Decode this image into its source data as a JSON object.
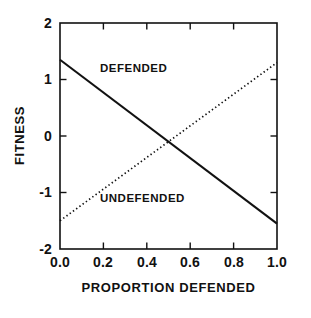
{
  "chart_data": {
    "type": "line",
    "title": "",
    "subtitle": "",
    "xlabel": "PROPORTION DEFENDED",
    "ylabel": "FITNESS",
    "xlim": [
      0.0,
      1.0
    ],
    "ylim": [
      -2,
      2
    ],
    "grid": false,
    "legend_position": "inline-annotations",
    "xticks": [
      "0.0",
      "0.2",
      "0.4",
      "0.6",
      "0.8",
      "1.0"
    ],
    "xtick_values": [
      0.0,
      0.2,
      0.4,
      0.6,
      0.8,
      1.0
    ],
    "yticks": [
      "2",
      "1",
      "0",
      "-1",
      "-2"
    ],
    "ytick_values": [
      2,
      1,
      0,
      -1,
      -2
    ],
    "series": [
      {
        "name": "DEFENDED",
        "style": "solid",
        "color": "#111111",
        "x": [
          0.0,
          1.0
        ],
        "values": [
          1.35,
          -1.55
        ]
      },
      {
        "name": "UNDEFENDED",
        "style": "dotted",
        "color": "#111111",
        "x": [
          0.0,
          1.0
        ],
        "values": [
          -1.5,
          1.3
        ]
      }
    ],
    "annotations": [
      {
        "text": "DEFENDED",
        "x": 0.24,
        "y": 1.07
      },
      {
        "text": "UNDEFENDED",
        "x": 0.24,
        "y": -1.2
      }
    ],
    "intersection": {
      "x": 0.52,
      "y": -0.15
    }
  },
  "axes": {
    "y_ticks": [
      {
        "label": "2"
      },
      {
        "label": "1"
      },
      {
        "label": "0"
      },
      {
        "label": "-1"
      },
      {
        "label": "-2"
      }
    ],
    "x_ticks": [
      {
        "label": "0.0"
      },
      {
        "label": "0.2"
      },
      {
        "label": "0.4"
      },
      {
        "label": "0.6"
      },
      {
        "label": "0.8"
      },
      {
        "label": "1.0"
      }
    ],
    "x_title": "PROPORTION DEFENDED",
    "y_title": "FITNESS"
  },
  "annotations": {
    "defended": "DEFENDED",
    "undefended": "UNDEFENDED"
  },
  "colors": {
    "ink": "#111111",
    "background": "#ffffff"
  }
}
